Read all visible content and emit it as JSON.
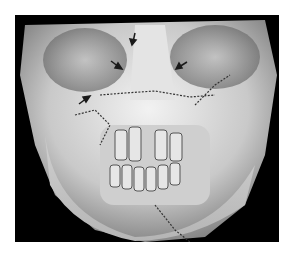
{
  "figure": {
    "background_color": "#000000",
    "page_color": "#ffffff",
    "bone_color": "#d8d8d8",
    "arrow_color": "#1a1a1a",
    "arrows": [
      {
        "name": "arrow-left-maxilla",
        "x": 88,
        "y": 97
      },
      {
        "name": "arrow-nasal-left",
        "x": 122,
        "y": 65
      },
      {
        "name": "arrow-nasal-top",
        "x": 135,
        "y": 40
      },
      {
        "name": "arrow-right-orbit",
        "x": 178,
        "y": 67
      }
    ]
  }
}
